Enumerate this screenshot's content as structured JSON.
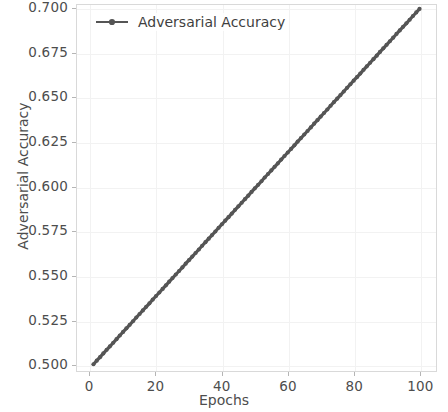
{
  "chart_data": {
    "type": "line",
    "title": "",
    "xlabel": "Epochs",
    "ylabel": "Adversarial Accuracy",
    "xlim": [
      -4.0,
      105.0
    ],
    "ylim": [
      0.4962,
      0.7022
    ],
    "xticks": [
      0,
      20,
      40,
      60,
      80,
      100
    ],
    "xtick_labels": [
      "0",
      "20",
      "40",
      "60",
      "80",
      "100"
    ],
    "yticks": [
      0.5,
      0.525,
      0.55,
      0.575,
      0.6,
      0.625,
      0.65,
      0.675,
      0.7
    ],
    "ytick_labels": [
      "0.500",
      "0.525",
      "0.550",
      "0.575",
      "0.600",
      "0.625",
      "0.650",
      "0.675",
      "0.700"
    ],
    "grid": true,
    "legend_position": "upper left",
    "legend_frame": false,
    "series": [
      {
        "name": "Adversarial Accuracy",
        "color": "#555555",
        "marker": "circle",
        "linestyle": "solid",
        "x": [
          1,
          2,
          3,
          4,
          5,
          6,
          7,
          8,
          9,
          10,
          11,
          12,
          13,
          14,
          15,
          16,
          17,
          18,
          19,
          20,
          21,
          22,
          23,
          24,
          25,
          26,
          27,
          28,
          29,
          30,
          31,
          32,
          33,
          34,
          35,
          36,
          37,
          38,
          39,
          40,
          41,
          42,
          43,
          44,
          45,
          46,
          47,
          48,
          49,
          50,
          51,
          52,
          53,
          54,
          55,
          56,
          57,
          58,
          59,
          60,
          61,
          62,
          63,
          64,
          65,
          66,
          67,
          68,
          69,
          70,
          71,
          72,
          73,
          74,
          75,
          76,
          77,
          78,
          79,
          80,
          81,
          82,
          83,
          84,
          85,
          86,
          87,
          88,
          89,
          90,
          91,
          92,
          93,
          94,
          95,
          96,
          97,
          98,
          99,
          100
        ],
        "y": [
          0.5,
          0.502,
          0.504,
          0.5061,
          0.5081,
          0.5101,
          0.5121,
          0.5141,
          0.5162,
          0.5182,
          0.5202,
          0.5222,
          0.5242,
          0.5263,
          0.5283,
          0.5303,
          0.5323,
          0.5343,
          0.5364,
          0.5384,
          0.5404,
          0.5424,
          0.5444,
          0.5465,
          0.5485,
          0.5505,
          0.5525,
          0.5545,
          0.5566,
          0.5586,
          0.5606,
          0.5626,
          0.5646,
          0.5667,
          0.5687,
          0.5707,
          0.5727,
          0.5747,
          0.5768,
          0.5788,
          0.5808,
          0.5828,
          0.5848,
          0.5869,
          0.5889,
          0.5909,
          0.5929,
          0.5949,
          0.597,
          0.599,
          0.601,
          0.603,
          0.6051,
          0.6071,
          0.6091,
          0.6111,
          0.6131,
          0.6152,
          0.6172,
          0.6192,
          0.6212,
          0.6232,
          0.6253,
          0.6273,
          0.6293,
          0.6313,
          0.6333,
          0.6354,
          0.6374,
          0.6394,
          0.6414,
          0.6434,
          0.6455,
          0.6475,
          0.6495,
          0.6515,
          0.6535,
          0.6556,
          0.6576,
          0.6596,
          0.6616,
          0.6636,
          0.6657,
          0.6677,
          0.6697,
          0.6717,
          0.6737,
          0.6758,
          0.6778,
          0.6798,
          0.6818,
          0.6838,
          0.6859,
          0.6879,
          0.6899,
          0.6919,
          0.6939,
          0.696,
          0.698,
          0.7
        ]
      }
    ]
  },
  "legend": {
    "entries": [
      {
        "label": "Adversarial Accuracy",
        "color": "#555555"
      }
    ]
  },
  "axes": {
    "xlabel": "Epochs",
    "ylabel": "Adversarial Accuracy"
  },
  "colors": {
    "line": "#555555",
    "grid": "#f2f2f2",
    "spine": "#d9d9d9",
    "tick_text": "#4d4d4d",
    "background": "#ffffff"
  }
}
